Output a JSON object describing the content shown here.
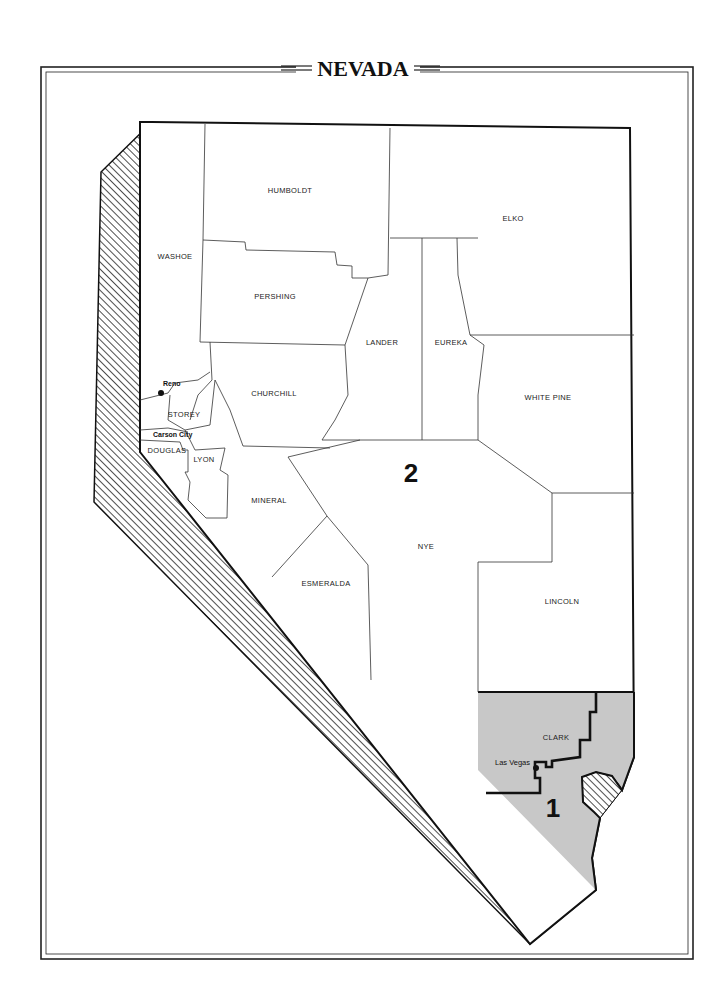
{
  "title": "NEVADA",
  "colors": {
    "background": "#ffffff",
    "frame": "#222222",
    "district_1_fill": "#c8c8c8",
    "district_2_fill": "#ffffff",
    "hatch": "#222222"
  },
  "districts": [
    {
      "number": "1",
      "label": "1",
      "description": "Southern portion of Clark County including Las Vegas"
    },
    {
      "number": "2",
      "label": "2",
      "description": "Remainder of the state"
    }
  ],
  "counties": [
    {
      "name": "HUMBOLDT",
      "label": "HUMBOLDT"
    },
    {
      "name": "ELKO",
      "label": "ELKO"
    },
    {
      "name": "WASHOE",
      "label": "WASHOE"
    },
    {
      "name": "PERSHING",
      "label": "PERSHING"
    },
    {
      "name": "LANDER",
      "label": "LANDER"
    },
    {
      "name": "EUREKA",
      "label": "EUREKA"
    },
    {
      "name": "CHURCHILL",
      "label": "CHURCHILL"
    },
    {
      "name": "WHITE PINE",
      "label": "WHITE PINE"
    },
    {
      "name": "STOREY",
      "label": "STOREY"
    },
    {
      "name": "DOUGLAS",
      "label": "DOUGLAS"
    },
    {
      "name": "LYON",
      "label": "LYON"
    },
    {
      "name": "MINERAL",
      "label": "MINERAL"
    },
    {
      "name": "NYE",
      "label": "NYE"
    },
    {
      "name": "ESMERALDA",
      "label": "ESMERALDA"
    },
    {
      "name": "LINCOLN",
      "label": "LINCOLN"
    },
    {
      "name": "CLARK",
      "label": "CLARK"
    }
  ],
  "cities": [
    {
      "name": "Reno",
      "label": "Reno"
    },
    {
      "name": "Carson City",
      "label": "Carson City"
    },
    {
      "name": "Las Vegas",
      "label": "Las Vegas"
    }
  ]
}
